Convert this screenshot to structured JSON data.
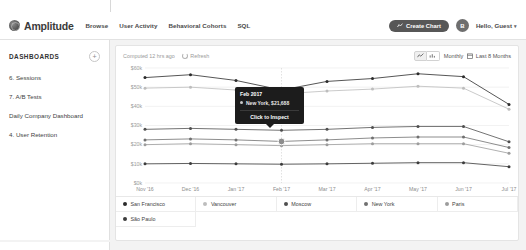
{
  "header": {
    "brand": "Amplitude",
    "logo_icon": "amplitude-logo-icon",
    "nav": [
      {
        "label": "Browse"
      },
      {
        "label": "User Activity"
      },
      {
        "label": "Behavioral Cohorts"
      },
      {
        "label": "SQL"
      }
    ],
    "create_chart_label": "Create Chart",
    "create_chart_icon": "chart-line-icon",
    "avatar_initial": "B",
    "user_menu_label": "Hello, Guest",
    "user_menu_caret": "▾"
  },
  "sidebar": {
    "title": "DASHBOARDS",
    "add_label": "+",
    "items": [
      {
        "label": "6. Sessions"
      },
      {
        "label": "7. A/B Tests"
      },
      {
        "label": "Daily Company Dashboard"
      },
      {
        "label": "4. User Retention"
      }
    ]
  },
  "toolbar": {
    "computed_label": "Computed 12 hrs ago",
    "refresh_label": "Refresh",
    "refresh_icon": "refresh-icon",
    "view_line_icon": "line-chart-icon",
    "view_bar_icon": "bar-chart-icon",
    "interval_label": "Monthly",
    "date_range_label": "Last 8 Months",
    "calendar_icon": "calendar-icon"
  },
  "tooltip": {
    "title": "Feb 2017",
    "series_label": "New York",
    "value": "$21,688",
    "row_text": "New York, $21,688",
    "action": "Click to Inspect"
  },
  "legend": [
    {
      "label": "San Francisco",
      "color": "#2b2b2b"
    },
    {
      "label": "Vancouver",
      "color": "#bdbdbd"
    },
    {
      "label": "Moscow",
      "color": "#4f4f4f"
    },
    {
      "label": "New York",
      "color": "#707070"
    },
    {
      "label": "Paris",
      "color": "#9c9c9c"
    },
    {
      "label": "São Paulo",
      "color": "#3c3c3c"
    }
  ],
  "chart_data": {
    "type": "line",
    "title": "",
    "xlabel": "",
    "ylabel": "",
    "grid": true,
    "legend_position": "bottom",
    "x": [
      "Nov '16",
      "Dec '16",
      "Jan '17",
      "Feb '17",
      "Mar '17",
      "Apr '17",
      "May '17",
      "Jun '17",
      "Jul '17"
    ],
    "ytick_labels": [
      "$60k",
      "$50k",
      "$40k",
      "$30k",
      "$20k",
      "$10k",
      "$0k"
    ],
    "ytick_values": [
      60000,
      50000,
      40000,
      30000,
      20000,
      10000,
      0
    ],
    "ylim": [
      0,
      60000
    ],
    "series": [
      {
        "name": "San Francisco",
        "color": "#2b2b2b",
        "values": [
          55000,
          56500,
          53500,
          48500,
          53000,
          54500,
          57000,
          55500,
          41000
        ]
      },
      {
        "name": "Vancouver",
        "color": "#bdbdbd",
        "values": [
          49500,
          50000,
          48500,
          46500,
          48000,
          49000,
          50500,
          49500,
          38500
        ]
      },
      {
        "name": "Moscow",
        "color": "#4f4f4f",
        "values": [
          28000,
          28500,
          28000,
          27500,
          28000,
          29000,
          29500,
          29500,
          21500
        ]
      },
      {
        "name": "New York",
        "color": "#707070",
        "values": [
          22500,
          23000,
          22500,
          21688,
          22500,
          23500,
          24000,
          24000,
          18500
        ]
      },
      {
        "name": "Paris",
        "color": "#9c9c9c",
        "values": [
          20000,
          20500,
          20000,
          19500,
          20000,
          20500,
          20500,
          20500,
          15500
        ]
      },
      {
        "name": "São Paulo",
        "color": "#3c3c3c",
        "values": [
          10000,
          10200,
          10000,
          9800,
          10000,
          10300,
          10600,
          10600,
          8500
        ]
      }
    ],
    "highlight": {
      "x": "Feb '17",
      "series": "New York",
      "value": 21688
    }
  }
}
